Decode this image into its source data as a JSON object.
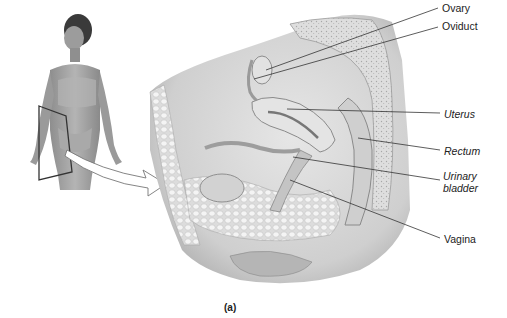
{
  "figure": {
    "caption": "(a)"
  },
  "labels": [
    {
      "id": "ovary",
      "text": "Ovary",
      "italic": false,
      "x": 442,
      "y": 2
    },
    {
      "id": "oviduct",
      "text": "Oviduct",
      "italic": false,
      "x": 442,
      "y": 20
    },
    {
      "id": "uterus",
      "text": "Uterus",
      "italic": true,
      "x": 444,
      "y": 108
    },
    {
      "id": "rectum",
      "text": "Rectum",
      "italic": true,
      "x": 444,
      "y": 145
    },
    {
      "id": "urinary_bladder_1",
      "text": "Urinary",
      "italic": true,
      "x": 443,
      "y": 170
    },
    {
      "id": "urinary_bladder_2",
      "text": "bladder",
      "italic": true,
      "x": 443,
      "y": 182
    },
    {
      "id": "vagina",
      "text": "Vagina",
      "italic": false,
      "x": 444,
      "y": 233
    }
  ],
  "leaders": [
    {
      "id": "ovary",
      "x1": 266,
      "y1": 70,
      "x2": 438,
      "y2": 8
    },
    {
      "id": "oviduct",
      "x1": 254,
      "y1": 79,
      "x2": 438,
      "y2": 27
    },
    {
      "id": "uterus",
      "x1": 287,
      "y1": 109,
      "x2": 440,
      "y2": 113
    },
    {
      "id": "rectum",
      "x1": 358,
      "y1": 138,
      "x2": 440,
      "y2": 150
    },
    {
      "id": "urinary_bladder",
      "x1": 293,
      "y1": 157,
      "x2": 440,
      "y2": 180
    },
    {
      "id": "vagina",
      "x1": 290,
      "y1": 180,
      "x2": 440,
      "y2": 238
    }
  ],
  "colors": {
    "background": "#ffffff",
    "text": "#222222",
    "leader_line": "#333333",
    "tissue_light": "#e9e9e9",
    "tissue_mid": "#c8c8c8",
    "tissue_dark": "#8f8f8f",
    "skin": "#a7a7a7"
  }
}
